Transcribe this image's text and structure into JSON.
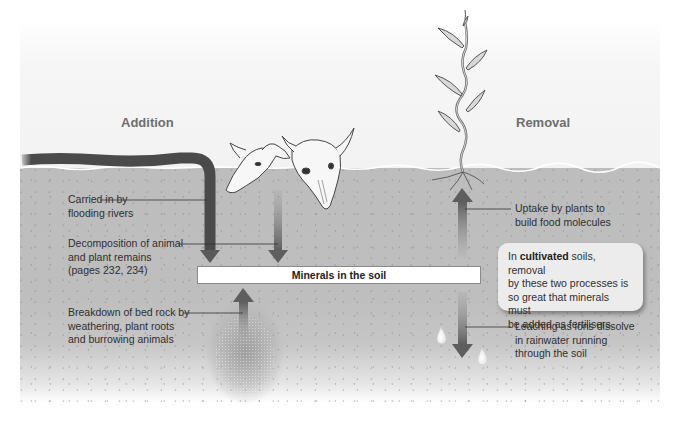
{
  "diagram": {
    "type": "mineral-cycle-in-soil",
    "headings": {
      "addition": "Addition",
      "removal": "Removal"
    },
    "center_box": "Minerals in the soil",
    "addition_notes": [
      {
        "id": "rivers",
        "lines": [
          "Carried in by",
          "flooding rivers"
        ]
      },
      {
        "id": "decomposition",
        "lines": [
          "Decomposition of animal",
          "and plant remains",
          "(pages 232, 234)"
        ]
      },
      {
        "id": "bedrock",
        "lines": [
          "Breakdown of bed rock by",
          "weathering, plant roots",
          "and burrowing animals"
        ]
      }
    ],
    "removal_notes": [
      {
        "id": "uptake",
        "lines": [
          "Uptake by plants to",
          "build food molecules"
        ]
      },
      {
        "id": "leaching",
        "lines": [
          "Leaching as ions dissolve",
          "in rainwater running",
          "through the soil"
        ]
      }
    ],
    "callout": {
      "prefix": "In ",
      "bold": "cultivated",
      "rest_line1": " soils, removal",
      "lines": [
        "by these two processes is",
        "so great that minerals must",
        "be added as fertilisers."
      ]
    },
    "icons": [
      "river-icon",
      "animal-skull-icon",
      "plant-icon",
      "water-droplet-icon",
      "bedrock-icon"
    ],
    "colors": {
      "soil": "#bdbdbd",
      "arrow": "#6a6a6a",
      "river": "#4a4a4a",
      "heading": "#6e6e6e",
      "callout_bg": "#ececec"
    }
  }
}
